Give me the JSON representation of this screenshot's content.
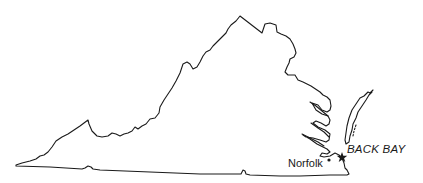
{
  "map": {
    "region": "Virginia",
    "stroke_color": "#1a1a1a",
    "background_color": "#ffffff",
    "labels": {
      "city": "Norfolk",
      "site": "BACK BAY"
    },
    "markers": [
      {
        "name": "Norfolk",
        "type": "dot",
        "x": 329,
        "y": 160
      },
      {
        "name": "BACK BAY",
        "type": "star",
        "x": 342,
        "y": 157
      }
    ]
  }
}
